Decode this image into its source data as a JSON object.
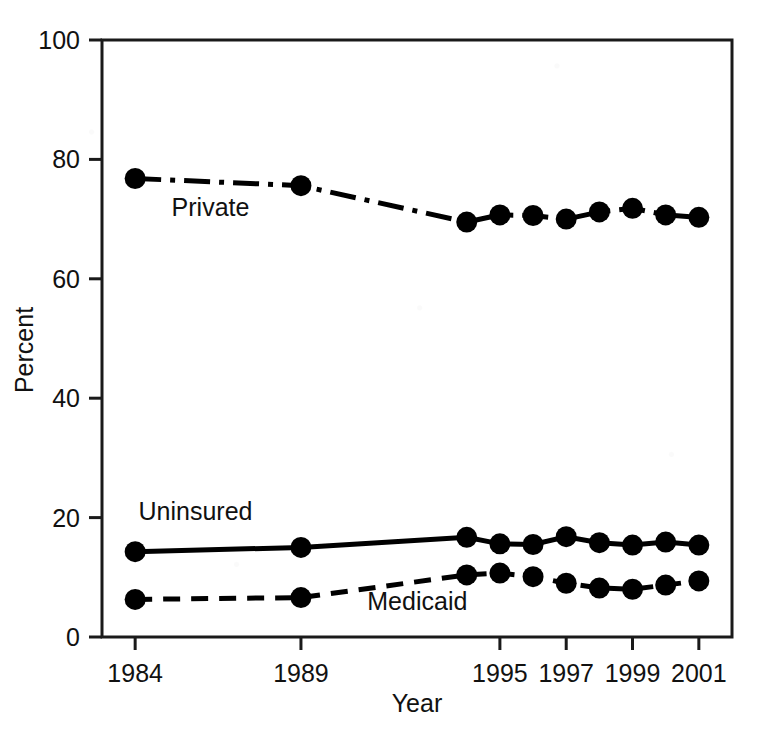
{
  "chart_data": {
    "type": "line",
    "title": "",
    "subtitle": "",
    "xlabel": "Year",
    "ylabel": "Percent",
    "ylim": [
      0,
      100
    ],
    "yticks": [
      0,
      20,
      40,
      60,
      80,
      100
    ],
    "xlim": [
      1983.0,
      2002.0
    ],
    "xtick_labels": [
      "1984",
      "1989",
      "1995",
      "1997",
      "1999",
      "2001"
    ],
    "xtick_values": [
      1984,
      1989,
      1995,
      1997,
      1999,
      2001
    ],
    "grid": false,
    "legend_position": "inline-annotations",
    "x": [
      1984,
      1989,
      1994,
      1995,
      1996,
      1997,
      1998,
      1999,
      2000,
      2001
    ],
    "series": [
      {
        "name": "Private",
        "label": "Private",
        "linestyle": "dash-dot",
        "marker": "filled-circle",
        "color": "#000000",
        "values": [
          76.8,
          75.6,
          69.5,
          70.7,
          70.6,
          70.0,
          71.2,
          71.8,
          70.7,
          70.3
        ],
        "label_x": 1985.1,
        "label_y": 70.5
      },
      {
        "name": "Uninsured",
        "label": "Uninsured",
        "linestyle": "solid",
        "marker": "filled-circle",
        "color": "#000000",
        "values": [
          14.3,
          15.0,
          16.7,
          15.6,
          15.5,
          16.8,
          15.8,
          15.4,
          15.9,
          15.4
        ],
        "label_x": 1984.1,
        "label_y": 19.6
      },
      {
        "name": "Medicaid",
        "label": "Medicaid",
        "linestyle": "dashed",
        "marker": "filled-circle",
        "color": "#000000",
        "values": [
          6.3,
          6.6,
          10.4,
          10.7,
          10.1,
          9.0,
          8.2,
          8.0,
          8.7,
          9.4
        ],
        "label_x": 1991.0,
        "label_y": 4.6
      }
    ]
  },
  "figure": {
    "background_color": "#ffffff",
    "foreground_color": "#000000",
    "frame_color": "#1a1a1a"
  }
}
